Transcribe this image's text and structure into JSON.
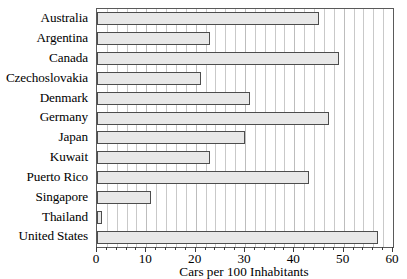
{
  "chart_data": {
    "type": "bar",
    "orientation": "horizontal",
    "title": "",
    "xlabel": "Cars per 100 Inhabitants",
    "ylabel": "",
    "xlim": [
      0,
      60
    ],
    "xticks": [
      0,
      10,
      20,
      30,
      40,
      50,
      60
    ],
    "xtick_labels": [
      "0",
      "10",
      "20",
      "30",
      "40",
      "50",
      "60"
    ],
    "minor_tick_interval": 2,
    "grid": true,
    "grid_axis": "x",
    "legend": "none",
    "bar_fill_color": "#e8e8e8",
    "bar_edge_color": "#4d4d4d",
    "categories": [
      "Australia",
      "Argentina",
      "Canada",
      "Czechoslovakia",
      "Denmark",
      "Germany",
      "Japan",
      "Kuwait",
      "Puerto Rico",
      "Singapore",
      "Thailand",
      "United States"
    ],
    "values": [
      45,
      23,
      49,
      21,
      31,
      47,
      30,
      23,
      43,
      11,
      1,
      57
    ]
  }
}
